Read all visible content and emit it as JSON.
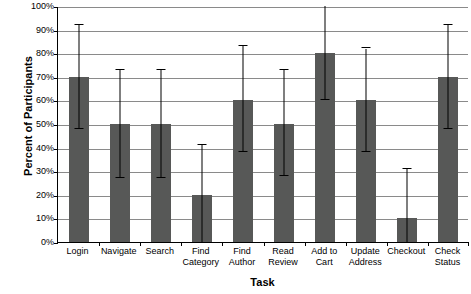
{
  "chart_data": {
    "type": "bar",
    "title": "",
    "xlabel": "Task",
    "ylabel": "Percent of Participants",
    "ylim": [
      0,
      100
    ],
    "ytick_labels": [
      "0%",
      "10%",
      "20%",
      "30%",
      "40%",
      "50%",
      "60%",
      "70%",
      "80%",
      "90%",
      "100%"
    ],
    "ytick_values": [
      0,
      10,
      20,
      30,
      40,
      50,
      60,
      70,
      80,
      90,
      100
    ],
    "grid": true,
    "legend": "none",
    "bar_color": "#575857",
    "error_bar_color": "#000000",
    "categories": [
      "Login",
      "Navigate",
      "Search",
      "Find\nCategory",
      "Find\nAuthor",
      "Read\nReview",
      "Add to\nCart",
      "Update\nAddress",
      "Checkout",
      "Check\nStatus"
    ],
    "values": [
      70,
      50,
      50,
      20,
      60,
      50,
      80,
      60,
      10,
      70
    ],
    "error_upper": [
      92,
      73,
      73,
      41,
      83,
      73,
      100,
      82,
      31,
      92
    ],
    "error_lower": [
      48,
      27,
      27,
      0,
      38,
      28,
      60,
      38,
      0,
      48
    ]
  }
}
